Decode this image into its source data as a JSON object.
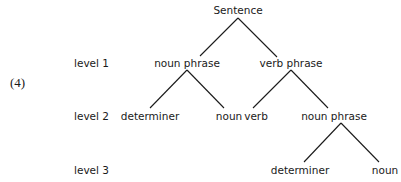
{
  "figure": {
    "number_label": "(4)",
    "levels": [
      "level 1",
      "level 2",
      "level 3"
    ],
    "root": "Sentence",
    "nodes": {
      "root": {
        "label": "Sentence",
        "x": 238,
        "y": 10
      },
      "l1_np": {
        "label": "noun phrase",
        "x": 187,
        "y": 63
      },
      "l1_vp": {
        "label": "verb phrase",
        "x": 291,
        "y": 63
      },
      "l2_det": {
        "label": "determiner",
        "x": 150,
        "y": 116
      },
      "l2_noun": {
        "label": "noun",
        "x": 229,
        "y": 116
      },
      "l2_verb": {
        "label": "verb",
        "x": 256,
        "y": 116
      },
      "l2_np": {
        "label": "noun phrase",
        "x": 334,
        "y": 116
      },
      "l3_det": {
        "label": "determiner",
        "x": 300,
        "y": 170
      },
      "l3_noun": {
        "label": "noun",
        "x": 385,
        "y": 170
      }
    },
    "edges": [
      [
        "root",
        "l1_np"
      ],
      [
        "root",
        "l1_vp"
      ],
      [
        "l1_np",
        "l2_det"
      ],
      [
        "l1_np",
        "l2_noun"
      ],
      [
        "l1_vp",
        "l2_verb"
      ],
      [
        "l1_vp",
        "l2_np"
      ],
      [
        "l2_np",
        "l3_det"
      ],
      [
        "l2_np",
        "l3_noun"
      ]
    ]
  }
}
